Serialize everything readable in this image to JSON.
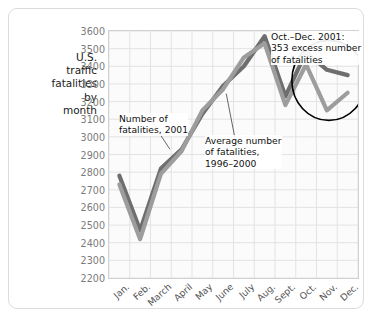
{
  "axis_title": "U.S. traffic fatalities by month",
  "annotations": {
    "series_2001": "Number of\nfatalities, 2001",
    "series_avg": "Average number\nof fatalities,\n1996–2000",
    "excess": "Oct.–Dec. 2001:\n353 excess number\nof fatalities"
  },
  "colors": {
    "series_2001": "#9d9d9d",
    "series_avg": "#6e6e6e",
    "grid": "#e3e3e3",
    "frame": "#d2d2d2",
    "circle": "#000000",
    "tick_text": "#7b7b7b"
  },
  "chart_data": {
    "type": "line",
    "xlabel": "",
    "ylabel": "U.S. traffic fatalities by month",
    "ylim": [
      2200,
      3600
    ],
    "yticks": [
      2200,
      2300,
      2400,
      2500,
      2600,
      2700,
      2800,
      2900,
      3000,
      3100,
      3200,
      3300,
      3400,
      3500,
      3600
    ],
    "grid": true,
    "legend": "annotations",
    "categories": [
      "Jan.",
      "Feb.",
      "March",
      "April",
      "May",
      "June",
      "July",
      "Aug.",
      "Sept.",
      "Oct.",
      "Nov.",
      "Dec."
    ],
    "series": [
      {
        "name": "Number of fatalities, 2001",
        "color": "#9d9d9d",
        "values": [
          2730,
          2420,
          2790,
          2920,
          3150,
          3270,
          3450,
          3530,
          3180,
          3410,
          3150,
          3250
        ]
      },
      {
        "name": "Average number of fatalities, 1996–2000",
        "color": "#6e6e6e",
        "values": [
          2780,
          2470,
          2820,
          2930,
          3130,
          3290,
          3400,
          3570,
          3230,
          3480,
          3380,
          3350
        ]
      }
    ],
    "callout": {
      "text": "Oct.–Dec. 2001: 353 excess number of fatalities",
      "value": 353,
      "period": "Oct.–Dec. 2001",
      "highlight_months": [
        "Oct.",
        "Nov.",
        "Dec."
      ]
    }
  }
}
